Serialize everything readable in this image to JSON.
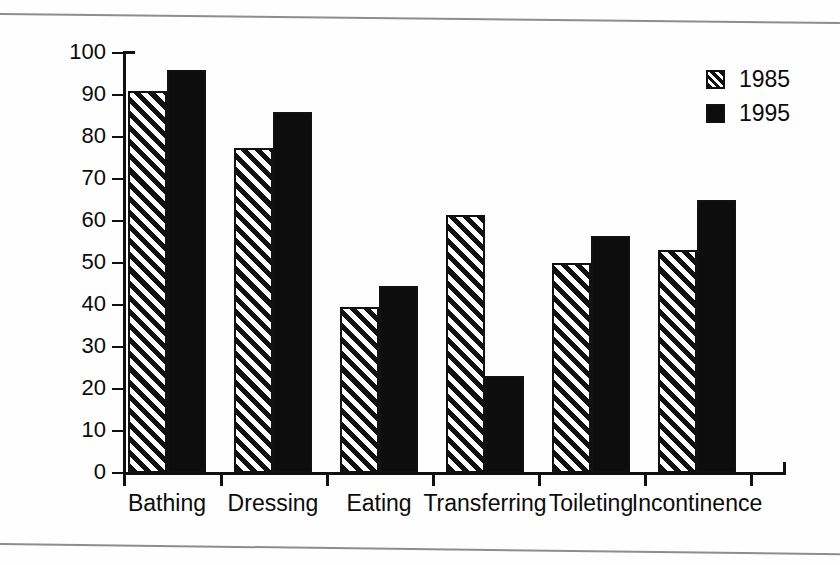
{
  "chart_data": {
    "type": "bar",
    "title": "",
    "xlabel": "",
    "ylabel": "Percent of residents",
    "ylim": [
      0,
      100
    ],
    "ytick_step": 10,
    "yticks": [
      "0",
      "10",
      "20",
      "30",
      "40",
      "50",
      "60",
      "70",
      "80",
      "90",
      "100"
    ],
    "grid": false,
    "legend_position": "top-right",
    "categories": [
      "Bathing",
      "Dressing",
      "Eating",
      "Transferring",
      "Toileting",
      "Incontinence"
    ],
    "series": [
      {
        "name": "1985",
        "pattern": "diagonal-hatch",
        "color": "#111111",
        "values": [
          91,
          77.5,
          39.5,
          61.5,
          50,
          53
        ]
      },
      {
        "name": "1995",
        "pattern": "solid",
        "color": "#0d0d0d",
        "values": [
          96,
          86,
          44.5,
          23,
          56.5,
          65
        ]
      }
    ]
  },
  "legend": {
    "entries": [
      {
        "label": "1985",
        "swatch": "hatch-swatch"
      },
      {
        "label": "1995",
        "swatch": "solid-swatch"
      }
    ]
  },
  "colors": {
    "ink": "#111111",
    "paper": "#fefefe",
    "rule": "#8d8d8d"
  }
}
